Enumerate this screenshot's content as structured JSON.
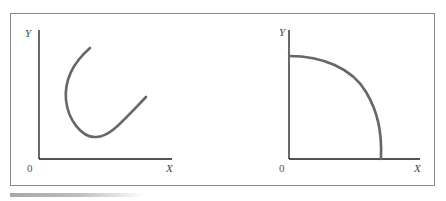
{
  "diagram": {
    "panels": [
      {
        "id": "left",
        "y_label": "Y",
        "x_label": "X",
        "origin_label": "0",
        "curve": "U-shaped curve opening upward"
      },
      {
        "id": "right",
        "y_label": "Y",
        "x_label": "X",
        "origin_label": "0",
        "curve": "concave quarter-circle from Y axis to X axis"
      }
    ],
    "colors": {
      "axis": "#1a1a1a",
      "curve": "#666666",
      "frame": "#8a8a8a"
    }
  }
}
